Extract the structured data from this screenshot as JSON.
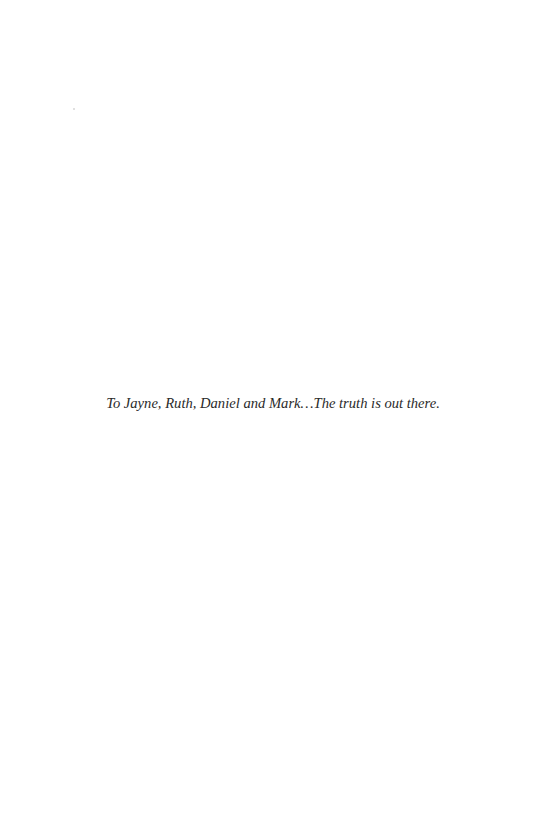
{
  "page": {
    "type": "dedication",
    "background_color": "#ffffff",
    "text_color": "#2a2a2a"
  },
  "dedication": {
    "text": "To Jayne, Ruth, Daniel and Mark…The truth is out there."
  }
}
